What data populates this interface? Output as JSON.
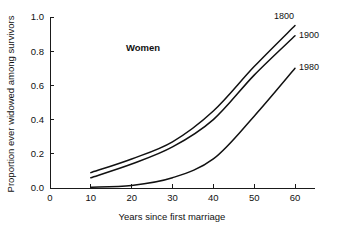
{
  "chart_data": {
    "type": "line",
    "title": "",
    "annotation": "Women",
    "xlabel": "Years since first marriage",
    "ylabel": "Proportion ever widowed among survivors",
    "xlim": [
      0,
      65
    ],
    "ylim": [
      0.0,
      1.0
    ],
    "xticks": [
      0,
      10,
      20,
      30,
      40,
      50,
      60
    ],
    "xtick_labels": [
      "0",
      "10",
      "20",
      "30",
      "40",
      "50",
      "60"
    ],
    "yticks": [
      0.0,
      0.2,
      0.4,
      0.6,
      0.8,
      1.0
    ],
    "ytick_labels": [
      "0.0",
      "0.2",
      "0.4",
      "0.6",
      "0.8",
      "1.0"
    ],
    "grid": false,
    "legend_position": "inline-right-end-labels",
    "x": [
      10,
      20,
      30,
      40,
      50,
      60
    ],
    "series": [
      {
        "name": "1800",
        "label": "1800",
        "color": "#111111",
        "values": [
          0.09,
          0.17,
          0.27,
          0.45,
          0.71,
          0.95
        ]
      },
      {
        "name": "1900",
        "label": "1900",
        "color": "#111111",
        "values": [
          0.06,
          0.14,
          0.24,
          0.4,
          0.66,
          0.89
        ]
      },
      {
        "name": "1980",
        "label": "1980",
        "color": "#111111",
        "values": [
          0.005,
          0.015,
          0.06,
          0.17,
          0.42,
          0.7
        ]
      }
    ]
  }
}
